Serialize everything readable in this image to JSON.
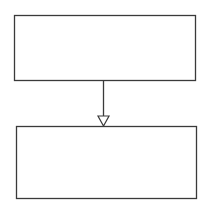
{
  "diagram": {
    "type": "flow",
    "nodes": [
      {
        "id": "top",
        "label": ""
      },
      {
        "id": "bottom",
        "label": ""
      }
    ],
    "edges": [
      {
        "from": "top",
        "to": "bottom",
        "arrowhead": "hollow-triangle"
      }
    ],
    "colors": {
      "stroke": "#3a3a3a",
      "background": "#ffffff"
    }
  }
}
